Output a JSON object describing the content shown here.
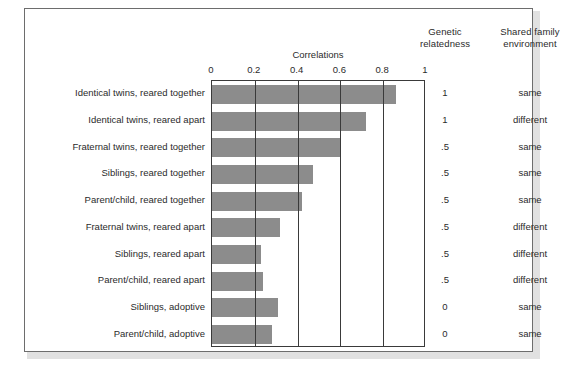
{
  "chart_data": {
    "type": "bar",
    "title": "Correlations",
    "xlabel": "",
    "ylabel": "",
    "orientation": "horizontal",
    "xlim": [
      0,
      1
    ],
    "grid": true,
    "legend": "none",
    "tick_labels": [
      "0",
      "0.2",
      "0.4",
      "0.6",
      "0.8",
      "1"
    ],
    "tick_values": [
      0,
      0.2,
      0.4,
      0.6,
      0.8,
      1
    ],
    "categories": [
      "Identical twins, reared together",
      "Identical twins, reared apart",
      "Fraternal twins, reared together",
      "Siblings, reared together",
      "Parent/child, reared together",
      "Fraternal twins, reared apart",
      "Siblings, reared apart",
      "Parent/child, reared apart",
      "Siblings, adoptive",
      "Parent/child, adoptive"
    ],
    "values": [
      0.86,
      0.72,
      0.6,
      0.47,
      0.42,
      0.32,
      0.23,
      0.24,
      0.31,
      0.28
    ],
    "bar_color": "#8c8c8c",
    "extra_columns": [
      {
        "header": "Genetic relatedness",
        "header_line1": "Genetic",
        "header_line2": "relatedness",
        "values": [
          "1",
          "1",
          ".5",
          ".5",
          ".5",
          ".5",
          ".5",
          ".5",
          "0",
          "0"
        ]
      },
      {
        "header": "Shared family environment",
        "header_line1": "Shared family",
        "header_line2": "environment",
        "values": [
          "same",
          "different",
          "same",
          "same",
          "same",
          "different",
          "different",
          "different",
          "same",
          "same"
        ]
      }
    ]
  },
  "figure": {
    "frame_color": "#6d6d6d",
    "axis_color": "#3a3a3a",
    "text_color": "#2b2b2b",
    "background": "#ffffff"
  }
}
